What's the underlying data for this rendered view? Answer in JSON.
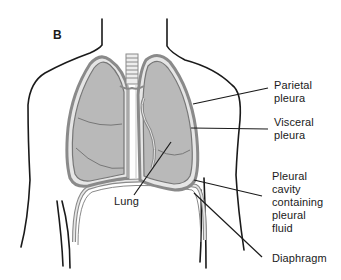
{
  "figure": {
    "panel_letter": "B"
  },
  "labels": {
    "parietal_pleura": [
      "Parietal",
      "pleura"
    ],
    "visceral_pleura": [
      "Visceral",
      "pleura"
    ],
    "lung": "Lung",
    "pleural_cavity": [
      "Pleural",
      "cavity",
      "containing",
      "pleural",
      "fluid"
    ],
    "diaphragm": "Diaphragm"
  },
  "colors": {
    "outline": "#1a1a1a",
    "lung_fill": "#b9b9b9",
    "pleura_band": "#8a8a8a",
    "pleura_gap": "#e6e6e6",
    "background": "#ffffff"
  }
}
